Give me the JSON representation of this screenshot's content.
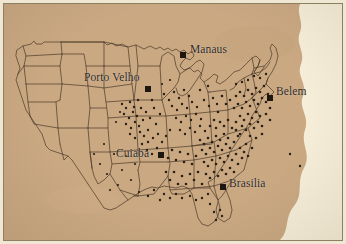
{
  "figure": {
    "kind": "scanned-map-figure",
    "background_color": "#f6eed9",
    "land_color": "#c9a882",
    "outline_color": "#4a3a28",
    "dot_color": "#2a2017",
    "frame_color": "#8c7f63",
    "paper_color": "#efe7d2"
  },
  "map": {
    "region": "continental-united-states",
    "boundaries": "state-outlines",
    "dots_description": "dense scatter of point locations concentrated in the eastern and midwestern states"
  },
  "cities": [
    {
      "name": "Manaus",
      "label_x": 186,
      "label_y": 44,
      "marker_x": 176,
      "marker_y": 48,
      "anchor": "left"
    },
    {
      "name": "Porto Velho",
      "label_x": 82,
      "label_y": 72,
      "marker_x": 141,
      "marker_y": 82,
      "anchor": "left"
    },
    {
      "name": "Belem",
      "label_x": 272,
      "label_y": 86,
      "marker_x": 263,
      "marker_y": 91,
      "anchor": "left"
    },
    {
      "name": "Cuiaba",
      "label_x": 113,
      "label_y": 147,
      "marker_x": 154,
      "marker_y": 148,
      "anchor": "left"
    },
    {
      "name": "Brasilia",
      "label_x": 225,
      "label_y": 176,
      "marker_x": 216,
      "marker_y": 180,
      "anchor": "left"
    }
  ],
  "markers": {
    "shape": "square",
    "size_px": 6,
    "color": "#1d1710"
  }
}
